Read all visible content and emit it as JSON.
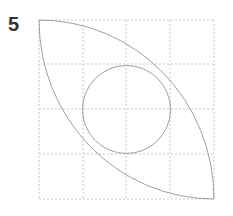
{
  "figure": {
    "label": "5",
    "grid": {
      "rows": 4,
      "cols": 4,
      "color": "#c8c8c8",
      "style": "dotted"
    },
    "shapes": [
      {
        "type": "lens",
        "description": "two quarter-circle arcs from top-left to bottom-right corners"
      },
      {
        "type": "circle",
        "description": "circle inscribed in central 2x2 cells"
      }
    ],
    "stroke_color": "#a0a0a0"
  }
}
